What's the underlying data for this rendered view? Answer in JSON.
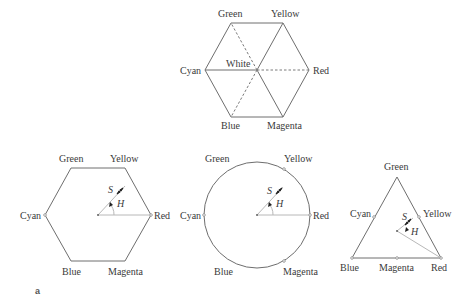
{
  "figure": {
    "panel_label": "a",
    "top_hexagon": {
      "labels": {
        "green": "Green",
        "yellow": "Yellow",
        "cyan": "Cyan",
        "white": "White",
        "red": "Red",
        "blue": "Blue",
        "magenta": "Magenta"
      }
    },
    "hexagon_model": {
      "labels": {
        "green": "Green",
        "yellow": "Yellow",
        "cyan": "Cyan",
        "red": "Red",
        "blue": "Blue",
        "magenta": "Magenta",
        "saturation": "S",
        "hue": "H"
      }
    },
    "circle_model": {
      "labels": {
        "green": "Green",
        "yellow": "Yellow",
        "cyan": "Cyan",
        "red": "Red",
        "blue": "Blue",
        "magenta": "Magenta",
        "saturation": "S",
        "hue": "H"
      }
    },
    "triangle_model": {
      "labels": {
        "green": "Green",
        "yellow": "Yellow",
        "cyan": "Cyan",
        "red": "Red",
        "blue": "Blue",
        "magenta": "Magenta",
        "saturation": "S",
        "hue": "H"
      }
    }
  }
}
